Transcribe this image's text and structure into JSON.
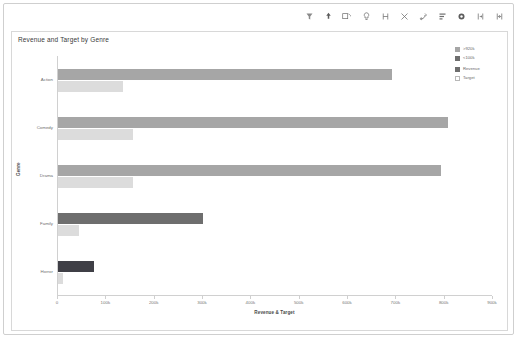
{
  "toolbar": {
    "icons": [
      {
        "name": "filter-funnel-icon",
        "glyph": "filter"
      },
      {
        "name": "drill-down-arrow-icon",
        "glyph": "arrow"
      },
      {
        "name": "edit-pencil-icon",
        "glyph": "pencil"
      },
      {
        "name": "lightbulb-insights-icon",
        "glyph": "bulb"
      },
      {
        "name": "drill-up-down-icon",
        "glyph": "drill"
      },
      {
        "name": "expand-hierarchy-icon",
        "glyph": "scissors"
      },
      {
        "name": "drill-through-icon",
        "glyph": "branch"
      },
      {
        "name": "sort-bars-icon",
        "glyph": "sort"
      },
      {
        "name": "more-options-icon",
        "glyph": "more"
      },
      {
        "name": "focus-mode-icon",
        "glyph": "focus"
      },
      {
        "name": "expand-fullscreen-icon",
        "glyph": "expand"
      }
    ]
  },
  "chart_data": {
    "type": "bar",
    "orientation": "horizontal",
    "title": "Revenue and Target by Genre",
    "xlabel": "Revenue & Target",
    "ylabel": "Genre",
    "categories": [
      "Action",
      "Comedy",
      "Drama",
      "Family",
      "Horror"
    ],
    "series": [
      {
        "name": "Revenue",
        "values": [
          690,
          806,
          792,
          300,
          74
        ],
        "colors": [
          "#a6a6a6",
          "#a6a6a6",
          "#a6a6a6",
          "#6e6e6e",
          "#3f3f46"
        ]
      },
      {
        "name": "Target",
        "values": [
          135,
          155,
          155,
          43,
          10
        ],
        "colors": [
          "#dcdcdc",
          "#dcdcdc",
          "#dcdcdc",
          "#dcdcdc",
          "#dcdcdc"
        ]
      }
    ],
    "xlim": [
      0,
      900
    ],
    "xticks": [
      0,
      100,
      200,
      300,
      400,
      500,
      600,
      700,
      800,
      900
    ],
    "xtick_labels": [
      "0",
      "100k",
      "200k",
      "300k",
      "400k",
      "500k",
      "600k",
      "700k",
      "800k",
      "900k"
    ],
    "grid": false,
    "legend_position": "right"
  },
  "legend": {
    "groups": [
      {
        "name": "threshold",
        "items": [
          {
            "label": ">920k",
            "color": "#a6a6a6",
            "hollow": false
          },
          {
            "label": "<100k",
            "color": "#6e6e6e",
            "hollow": false
          }
        ]
      },
      {
        "name": "series",
        "items": [
          {
            "label": "Revenue",
            "color": "#6e6e6e",
            "hollow": false
          },
          {
            "label": "Target",
            "color": "#ffffff",
            "hollow": true
          }
        ]
      }
    ]
  }
}
